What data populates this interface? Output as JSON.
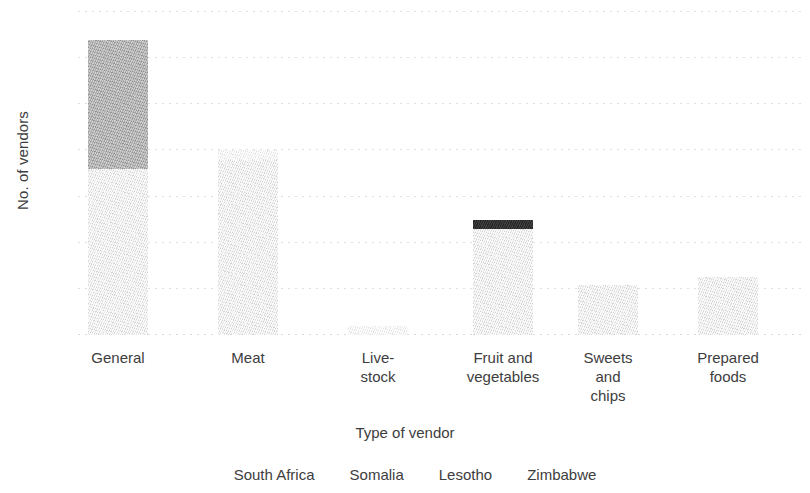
{
  "chart_data": {
    "type": "bar",
    "subtype": "stacked-bar",
    "title": "",
    "xlabel": "Type of vendor",
    "ylabel": "No. of vendors",
    "ylim": [
      0,
      35
    ],
    "ytick_values": [
      35,
      30,
      25,
      20,
      15,
      10,
      5,
      0
    ],
    "ytick_labels": [
      "35",
      "30",
      "25",
      "20",
      "15",
      "10",
      "5",
      "0"
    ],
    "grid": true,
    "grid_axis": "y",
    "grid_style": "dotted",
    "legend_position": "bottom",
    "categories": [
      "General",
      "Meat",
      "Live-stock",
      "Fruit and vegetables",
      "Sweets and chips",
      "Prepared foods"
    ],
    "category_label_lines": [
      [
        "General"
      ],
      [
        "Meat"
      ],
      [
        "Live-",
        "stock"
      ],
      [
        "Fruit and",
        "vegetables"
      ],
      [
        "Sweets",
        "and",
        "chips"
      ],
      [
        "Prepared",
        "foods"
      ]
    ],
    "series": [
      {
        "name": "South Africa",
        "color": "#e2e2e2",
        "values": [
          18,
          19,
          0,
          11.5,
          5.4,
          6.3
        ]
      },
      {
        "name": "Somalia",
        "color": "#a3a3a3",
        "values": [
          14,
          0,
          0,
          0,
          0,
          0
        ]
      },
      {
        "name": "Lesotho",
        "color": "#f1f1f1",
        "values": [
          0,
          1,
          1,
          0,
          0,
          0
        ]
      },
      {
        "name": "Zimbabwe",
        "color": "#333333",
        "values": [
          0,
          0,
          0,
          1,
          0,
          0
        ]
      }
    ],
    "totals": [
      32,
      20,
      1,
      12.5,
      5.4,
      6.3
    ],
    "stack_order": [
      "Zimbabwe",
      "Lesotho",
      "Somalia",
      "South Africa"
    ]
  },
  "legend": {
    "items": [
      {
        "label": "South Africa",
        "color": "#e2e2e2"
      },
      {
        "label": "Somalia",
        "color": "#a3a3a3"
      },
      {
        "label": "Lesotho",
        "color": "#f1f1f1"
      },
      {
        "label": "Zimbabwe",
        "color": "#333333"
      }
    ]
  }
}
